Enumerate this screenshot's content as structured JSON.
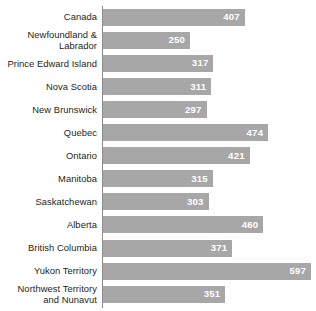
{
  "chart_data": {
    "type": "bar",
    "orientation": "horizontal",
    "title": "",
    "subtitle": "",
    "xlabel": "",
    "ylabel": "",
    "grid": false,
    "legend": null,
    "xlim": [
      0,
      610
    ],
    "bar_color": "#a7a7a7",
    "value_label_color": "#ffffff",
    "axis_color": "#8d8d8d",
    "categories": [
      "Canada",
      "Newfoundland &\nLabrador",
      "Prince Edward Island",
      "Nova Scotia",
      "New Brunswick",
      "Quebec",
      "Ontario",
      "Manitoba",
      "Saskatchewan",
      "Alberta",
      "British Columbia",
      "Yukon Territory",
      "Northwest Territory\nand Nunavut"
    ],
    "values": [
      407,
      250,
      317,
      311,
      297,
      474,
      421,
      315,
      303,
      460,
      371,
      597,
      351
    ]
  },
  "bars": [
    {
      "label": "Canada",
      "value": 407,
      "value_text": "407"
    },
    {
      "label": "Newfoundland &\nLabrador",
      "value": 250,
      "value_text": "250"
    },
    {
      "label": "Prince Edward Island",
      "value": 317,
      "value_text": "317"
    },
    {
      "label": "Nova Scotia",
      "value": 311,
      "value_text": "311"
    },
    {
      "label": "New Brunswick",
      "value": 297,
      "value_text": "297"
    },
    {
      "label": "Quebec",
      "value": 474,
      "value_text": "474"
    },
    {
      "label": "Ontario",
      "value": 421,
      "value_text": "421"
    },
    {
      "label": "Manitoba",
      "value": 315,
      "value_text": "315"
    },
    {
      "label": "Saskatchewan",
      "value": 303,
      "value_text": "303"
    },
    {
      "label": "Alberta",
      "value": 460,
      "value_text": "460"
    },
    {
      "label": "British Columbia",
      "value": 371,
      "value_text": "371"
    },
    {
      "label": "Yukon Territory",
      "value": 597,
      "value_text": "597"
    },
    {
      "label": "Northwest Territory\nand Nunavut",
      "value": 351,
      "value_text": "351"
    }
  ]
}
